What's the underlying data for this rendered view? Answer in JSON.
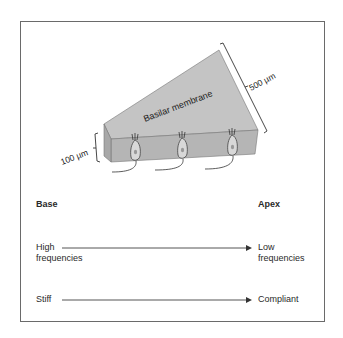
{
  "diagram": {
    "membrane_label": "Basilar membrane",
    "width_apex_label": "500 µm",
    "width_base_label": "100 µm",
    "hair_cell_count": 3,
    "colors": {
      "membrane_top": "#c4c4c4",
      "membrane_front": "#b3b3b3",
      "membrane_side": "#a8a8a8",
      "outline": "#555555",
      "frame": "#6a6a6a"
    }
  },
  "axis": {
    "left_heading": "Base",
    "right_heading": "Apex"
  },
  "gradients": [
    {
      "left_line1": "High",
      "left_line2": "frequencies",
      "right_line1": "Low",
      "right_line2": "frequencies"
    },
    {
      "left_line1": "Stiff",
      "right_line1": "Compliant"
    }
  ]
}
